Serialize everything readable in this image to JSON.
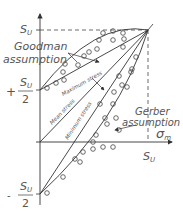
{
  "diagram": {
    "axes": {
      "x_label": "σ",
      "x_label_sub": "m",
      "x_tick_label": "S",
      "x_tick_sub": "U",
      "y_top_label": "S",
      "y_top_sub": "U",
      "y_plus_sign": "+",
      "y_plus_num": "S",
      "y_plus_num_sub": "U",
      "y_plus_den": "2",
      "y_minus_sign": "-",
      "y_minus_num": "S",
      "y_minus_num_sub": "U",
      "y_minus_den": "2"
    },
    "annotations": {
      "goodman_line1": "Goodman",
      "goodman_line2": "assumption",
      "gerber_line1": "Gerber",
      "gerber_line2": "assumption",
      "maximum_stress": "Maximum stress",
      "mean_stress": "Mean stress",
      "minimum_stress": "Minimum stress"
    },
    "colors": {
      "line": "#333333",
      "text": "#555555",
      "dashed": "#444444"
    }
  }
}
